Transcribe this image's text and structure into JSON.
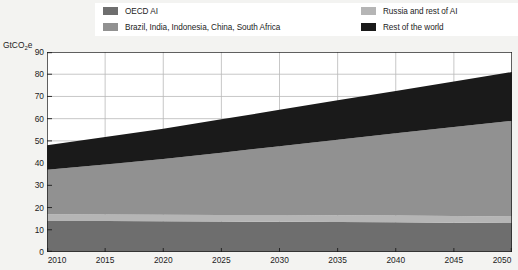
{
  "legend": {
    "items": [
      {
        "label": "OECD AI",
        "color": "#6e6e6e",
        "key": "oecd-ai"
      },
      {
        "label": "Brazil, India, Indonesia, China, South Africa",
        "color": "#919191",
        "key": "brics"
      },
      {
        "label": "Russia and rest of AI",
        "color": "#b5b5b5",
        "key": "russia-rest-ai"
      },
      {
        "label": "Rest of the world",
        "color": "#1a1a1a",
        "key": "rest-of-world"
      }
    ]
  },
  "axes": {
    "y_unit_label": "GtCO",
    "y_unit_subscript": "2",
    "y_unit_suffix": "e",
    "y_ticks": [
      "90",
      "80",
      "70",
      "60",
      "50",
      "40",
      "30",
      "20",
      "10",
      "0"
    ],
    "x_ticks": [
      "2010",
      "2015",
      "2020",
      "2025",
      "2030",
      "2035",
      "2040",
      "2045",
      "2050"
    ]
  },
  "chart_data": {
    "type": "area",
    "title": "",
    "subtitle": "",
    "xlabel": "",
    "ylabel": "GtCO2e",
    "xlim": [
      2010,
      2050
    ],
    "ylim": [
      0,
      90
    ],
    "ytick_step": 10,
    "xtick_step": 5,
    "grid": true,
    "grid_axis": "y",
    "stacked": true,
    "legend_position": "top",
    "x": [
      2010,
      2015,
      2020,
      2025,
      2030,
      2035,
      2040,
      2045,
      2050
    ],
    "series": [
      {
        "name": "OECD AI",
        "color": "#6e6e6e",
        "values": [
          14.0,
          13.9,
          13.8,
          13.7,
          13.6,
          13.5,
          13.4,
          13.2,
          13.0
        ]
      },
      {
        "name": "Russia and rest of AI",
        "color": "#b5b5b5",
        "values": [
          3.0,
          3.0,
          3.0,
          3.0,
          3.0,
          3.0,
          3.0,
          3.0,
          3.0
        ]
      },
      {
        "name": "Brazil, India, Indonesia, China, South Africa",
        "color": "#919191",
        "values": [
          20.0,
          22.5,
          25.0,
          28.0,
          31.0,
          34.0,
          37.0,
          40.0,
          43.0
        ]
      },
      {
        "name": "Rest of the world",
        "color": "#1a1a1a",
        "values": [
          11.0,
          12.4,
          13.7,
          15.0,
          16.4,
          17.8,
          19.1,
          20.5,
          22.0
        ]
      }
    ],
    "cumulative_totals": [
      48.0,
      51.8,
      55.5,
      59.7,
      64.0,
      68.3,
      72.5,
      76.7,
      81.0
    ]
  },
  "style": {
    "plot_background": "#ffffff",
    "page_background": "#f3f3f1",
    "grid_color": "#b9b9b9",
    "axis_color": "#1c1c1c",
    "text_color": "#1c1c1c"
  }
}
